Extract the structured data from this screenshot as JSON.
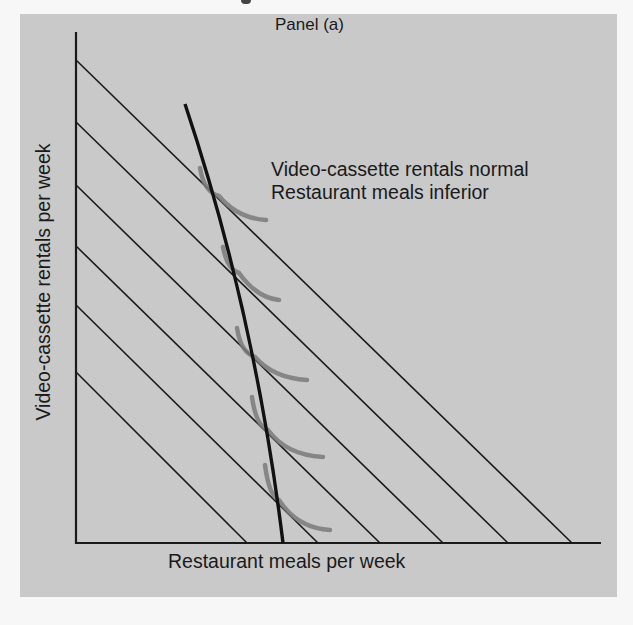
{
  "figure": {
    "panel_title": "Panel (a)",
    "annotation": {
      "line1": "Video-cassette rentals normal",
      "line2": "Restaurant meals inferior"
    },
    "x_axis_label": "Restaurant meals per week",
    "y_axis_label": "Video-cassette rentals per week",
    "colors": {
      "panel_background": "#c9c9c9",
      "axis": "#1a1a1a",
      "budget_lines": "#1a1a1a",
      "expansion_path": "#111111",
      "indifference_curves": "#7a7a7a"
    }
  },
  "geometry": {
    "origin": [
      76,
      543
    ],
    "y_axis_top": [
      76,
      32
    ],
    "x_axis_end": [
      601,
      543
    ],
    "budget_lines": [
      {
        "y_intercept": 60,
        "x_intercept": 572
      },
      {
        "y_intercept": 122,
        "x_intercept": 508
      },
      {
        "y_intercept": 185,
        "x_intercept": 443
      },
      {
        "y_intercept": 246,
        "x_intercept": 380
      },
      {
        "y_intercept": 305,
        "x_intercept": 318
      },
      {
        "y_intercept": 372,
        "x_intercept": 247
      }
    ],
    "expansion_path": {
      "start": [
        185,
        104
      ],
      "end": [
        283,
        543
      ]
    },
    "indifference_curves": [
      {
        "start": [
          200,
          168
        ],
        "tangent": [
          219,
          196
        ],
        "end": [
          266,
          220
        ]
      },
      {
        "start": [
          223,
          247
        ],
        "tangent": [
          239,
          273
        ],
        "end": [
          279,
          300
        ]
      },
      {
        "start": [
          237,
          328
        ],
        "tangent": [
          255,
          357
        ],
        "end": [
          307,
          380
        ]
      },
      {
        "start": [
          252,
          397
        ],
        "tangent": [
          268,
          430
        ],
        "end": [
          323,
          457
        ]
      },
      {
        "start": [
          265,
          465
        ],
        "tangent": [
          279,
          500
        ],
        "end": [
          330,
          530
        ]
      }
    ]
  }
}
